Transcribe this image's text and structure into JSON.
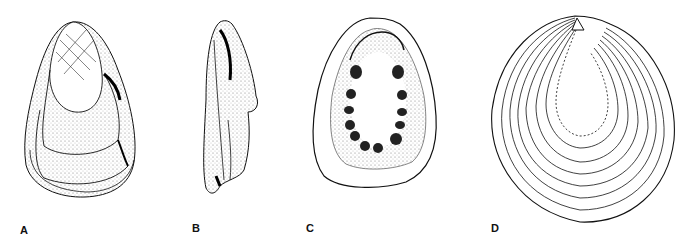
{
  "figure": {
    "panels": [
      {
        "id": "A",
        "label": "A",
        "description": "oyster shell, exterior view with concentric growth lamellae"
      },
      {
        "id": "B",
        "label": "B",
        "description": "oyster shell, side/profile view"
      },
      {
        "id": "C",
        "label": "C",
        "description": "oyster valve, interior view with ring of muscle scars"
      },
      {
        "id": "D",
        "label": "D",
        "description": "idealized shell outline with concentric growth lines"
      }
    ],
    "colors": {
      "ink": "#111111",
      "background": "#ffffff",
      "stipple": "#555555"
    }
  }
}
